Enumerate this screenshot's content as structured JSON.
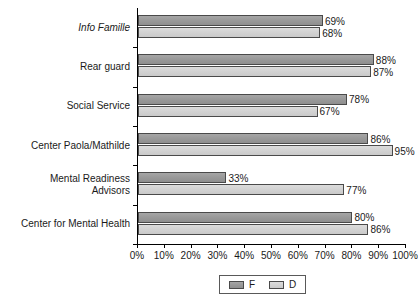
{
  "chart_data": {
    "type": "bar",
    "orientation": "horizontal",
    "title": "",
    "xlabel": "",
    "ylabel": "",
    "xlim": [
      0,
      100
    ],
    "xticks": [
      "0%",
      "10%",
      "20%",
      "30%",
      "40%",
      "50%",
      "60%",
      "70%",
      "80%",
      "90%",
      "100%"
    ],
    "xtick_values": [
      0,
      10,
      20,
      30,
      40,
      50,
      60,
      70,
      80,
      90,
      100
    ],
    "grid": false,
    "legend_position": "bottom",
    "categories": [
      "Info Famille",
      "Rear guard",
      "Social Service",
      "Center Paola/Mathilde",
      "Mental Readiness Advisors",
      "Center for Mental Health"
    ],
    "series": [
      {
        "name": "F",
        "color": "#9a9a9a",
        "values": [
          69,
          88,
          78,
          86,
          33,
          80
        ],
        "labels": [
          "69%",
          "88%",
          "78%",
          "86%",
          "33%",
          "80%"
        ]
      },
      {
        "name": "D",
        "color": "#d3d3d3",
        "values": [
          68,
          87,
          67,
          95,
          77,
          86
        ],
        "labels": [
          "68%",
          "87%",
          "67%",
          "95%",
          "77%",
          "86%"
        ]
      }
    ]
  },
  "categories_display": [
    {
      "lines": [
        "Info Famille"
      ],
      "italic": true
    },
    {
      "lines": [
        "Rear guard"
      ],
      "italic": false
    },
    {
      "lines": [
        "Social Service"
      ],
      "italic": false
    },
    {
      "lines": [
        "Center Paola/Mathilde"
      ],
      "italic": false
    },
    {
      "lines": [
        "Mental Readiness",
        "Advisors"
      ],
      "italic": false
    },
    {
      "lines": [
        "Center for Mental Health"
      ],
      "italic": false
    }
  ],
  "legend": {
    "items": [
      {
        "label": "F",
        "color": "#9a9a9a"
      },
      {
        "label": "D",
        "color": "#d3d3d3"
      }
    ]
  }
}
